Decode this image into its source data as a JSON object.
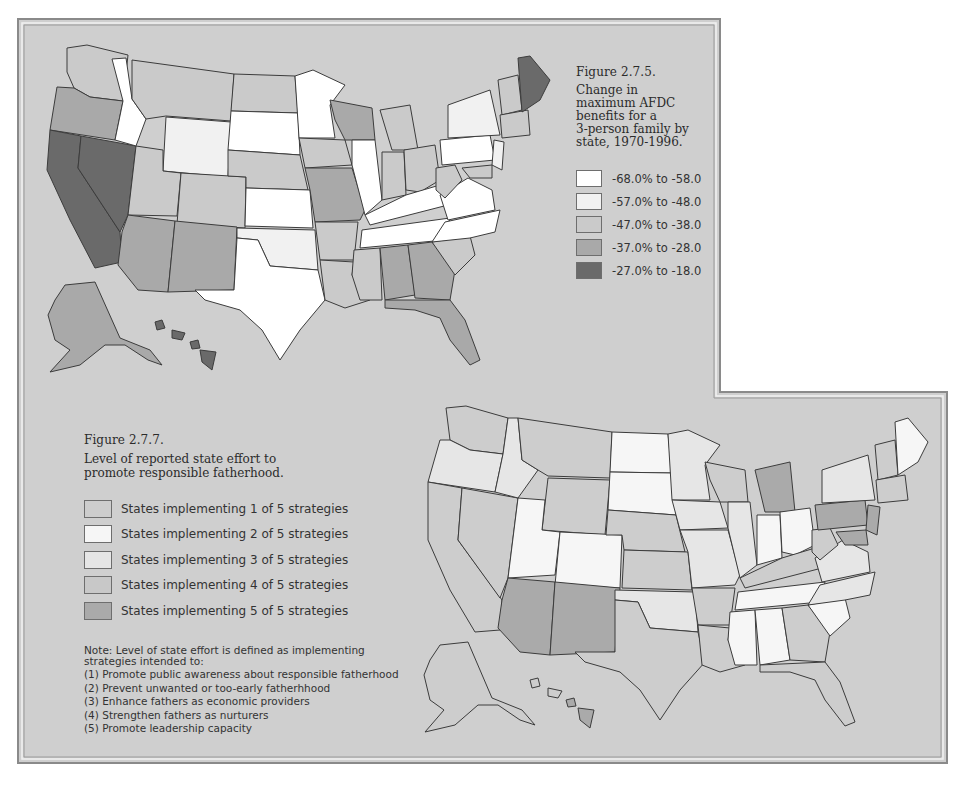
{
  "colors": {
    "page_bg": "#ffffff",
    "panel_bg": "#cfcfcf",
    "frame_outer": "#8a8a8a",
    "frame_inner": "#f2f2f2",
    "state_outline": "#3c3c3c"
  },
  "figure_275": {
    "label": "Figure 2.7.5.",
    "caption_lines": [
      "Change in",
      "maximum AFDC",
      "benefits for a",
      "3-person family by",
      "state, 1970-1996."
    ],
    "legend": [
      {
        "label": "-68.0% to -58.0",
        "color": "#ffffff"
      },
      {
        "label": "-57.0% to -48.0",
        "color": "#f1f1f1"
      },
      {
        "label": "-47.0% to -38.0",
        "color": "#cacaca"
      },
      {
        "label": "-37.0% to -28.0",
        "color": "#a9a9a9"
      },
      {
        "label": "-27.0% to -18.0",
        "color": "#6a6a6a"
      }
    ]
  },
  "figure_277": {
    "label": "Figure 2.7.7.",
    "caption_lines": [
      "Level of reported state effort to",
      "promote responsible fatherhood."
    ],
    "legend": [
      {
        "label": "States implementing 1 of 5 strategies",
        "color": "#cdcdcd"
      },
      {
        "label": "States implementing 2 of 5 strategies",
        "color": "#f6f6f6"
      },
      {
        "label": "States implementing 3 of 5 strategies",
        "color": "#e6e6e6"
      },
      {
        "label": "States implementing 4 of 5 strategies",
        "color": "#c8c8c8"
      },
      {
        "label": "States implementing 5 of 5 strategies",
        "color": "#aaaaaa"
      }
    ],
    "note_lines": [
      "Note: Level of state effort is defined as implementing",
      "strategies intended to:",
      "(1) Promote public awareness about responsible fatherhood",
      "(2) Prevent unwanted or too-early fatherhhood",
      "(3) Enhance fathers as economic providers",
      "(4) Strengthen fathers as nurturers",
      "(5) Promote leadership capacity"
    ]
  }
}
